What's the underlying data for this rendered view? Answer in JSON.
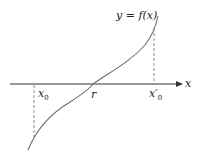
{
  "diagram": {
    "curve_label": "y = f(x)",
    "axis_label": "x",
    "points": [
      {
        "name": "x0",
        "label": "x",
        "subscript": "0"
      },
      {
        "name": "r",
        "label": "r"
      },
      {
        "name": "x0-prime",
        "label": "x′",
        "subscript": "0"
      }
    ],
    "colors": {
      "curve": "#6e6e6e",
      "axis": "#333333",
      "dashed": "#8a8a8a",
      "text": "#222222"
    }
  }
}
